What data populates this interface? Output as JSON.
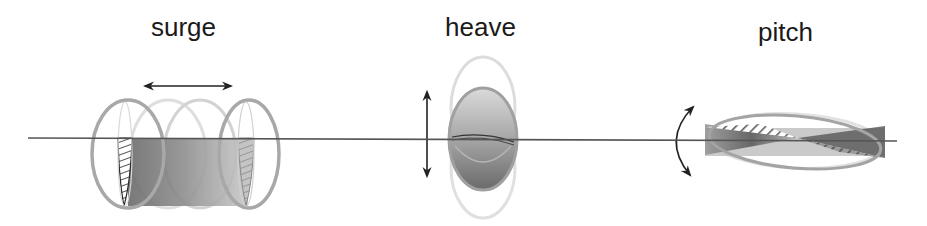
{
  "diagram": {
    "modes": [
      {
        "id": "surge",
        "label": "surge",
        "motion": "translation along horizontal axis"
      },
      {
        "id": "heave",
        "label": "heave",
        "motion": "translation along vertical axis"
      },
      {
        "id": "pitch",
        "label": "pitch",
        "motion": "rotation about transverse axis"
      }
    ],
    "colors": {
      "background": "#ffffff",
      "axis_line": "#555555",
      "arrow": "#222222",
      "outline": "#a8a8a8",
      "outline_faint": "#d6d6d6",
      "body_light": "#d4d4d4",
      "body_dark": "#6e6e6e",
      "hatch": "#2a2a2a",
      "label_text": "#1a1a1a"
    }
  }
}
